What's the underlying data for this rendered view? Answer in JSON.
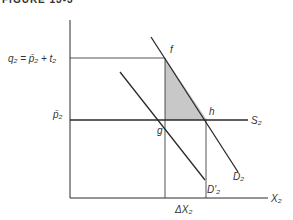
{
  "figure": {
    "title": "FIGURE 13-3"
  },
  "labels": {
    "q_label": "q₂ = p̄₂ + t₂",
    "p_label": "p̄₂",
    "point_f": "f",
    "point_g": "g",
    "point_h": "h",
    "supply_label": "S₂",
    "demand_label": "D₂",
    "demand_shifted_label": "D'₂",
    "x_axis_label": "X₂",
    "delta_label": "ΔX₂"
  },
  "colors": {
    "line": "#2a2a2a",
    "shade": "#c8c8c8",
    "text": "#333333"
  }
}
